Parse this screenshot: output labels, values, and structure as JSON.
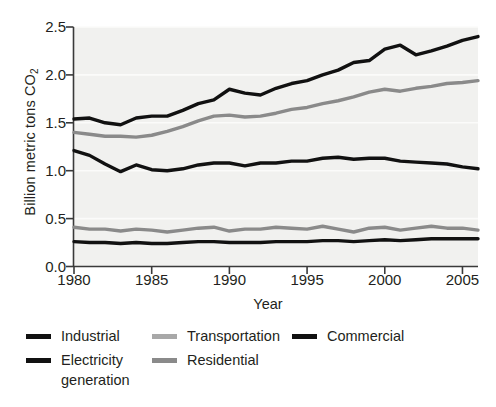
{
  "chart_data": {
    "type": "line",
    "title": "",
    "xlabel": "Year",
    "ylabel": "Billion metric tons CO2",
    "ylabel_plain": "Billion metric tons CO",
    "ylabel_sub": "2",
    "xlim": [
      1980,
      2006
    ],
    "ylim": [
      0.0,
      2.5
    ],
    "yticks": [
      "0.0",
      "0.5",
      "1.0",
      "1.5",
      "2.0",
      "2.5"
    ],
    "ytick_values": [
      0.0,
      0.5,
      1.0,
      1.5,
      2.0,
      2.5
    ],
    "xticks": [
      "1980",
      "1985",
      "1990",
      "1995",
      "2000",
      "2005"
    ],
    "xtick_values": [
      1980,
      1985,
      1990,
      1995,
      2000,
      2005
    ],
    "grid": "horizontal-faint",
    "legend_position": "below-plot",
    "plot_background": "#f1f1ef",
    "x": [
      1980,
      1981,
      1982,
      1983,
      1984,
      1985,
      1986,
      1987,
      1988,
      1989,
      1990,
      1991,
      1992,
      1993,
      1994,
      1995,
      1996,
      1997,
      1998,
      1999,
      2000,
      2001,
      2002,
      2003,
      2004,
      2005,
      2006
    ],
    "series": [
      {
        "name": "Electricity generation",
        "color": "#111111",
        "values": [
          1.54,
          1.55,
          1.5,
          1.48,
          1.55,
          1.57,
          1.57,
          1.63,
          1.7,
          1.74,
          1.85,
          1.81,
          1.79,
          1.86,
          1.91,
          1.94,
          2.0,
          2.05,
          2.13,
          2.15,
          2.27,
          2.31,
          2.21,
          2.25,
          2.3,
          2.36,
          2.4
        ]
      },
      {
        "name": "Transportation",
        "color": "#8a8a8a",
        "values": [
          1.4,
          1.38,
          1.36,
          1.36,
          1.35,
          1.37,
          1.41,
          1.46,
          1.52,
          1.57,
          1.58,
          1.56,
          1.57,
          1.6,
          1.64,
          1.66,
          1.7,
          1.73,
          1.77,
          1.82,
          1.85,
          1.83,
          1.86,
          1.88,
          1.91,
          1.92,
          1.94
        ]
      },
      {
        "name": "Industrial",
        "color": "#111111",
        "values": [
          1.21,
          1.16,
          1.07,
          0.99,
          1.06,
          1.01,
          1.0,
          1.02,
          1.06,
          1.08,
          1.08,
          1.05,
          1.08,
          1.08,
          1.1,
          1.1,
          1.13,
          1.14,
          1.12,
          1.13,
          1.13,
          1.1,
          1.09,
          1.08,
          1.07,
          1.04,
          1.02
        ]
      },
      {
        "name": "Residential",
        "color": "#8a8a8a",
        "values": [
          0.41,
          0.39,
          0.39,
          0.37,
          0.39,
          0.38,
          0.36,
          0.38,
          0.4,
          0.41,
          0.37,
          0.39,
          0.39,
          0.41,
          0.4,
          0.39,
          0.42,
          0.39,
          0.36,
          0.4,
          0.41,
          0.38,
          0.4,
          0.42,
          0.4,
          0.4,
          0.38
        ]
      },
      {
        "name": "Commercial",
        "color": "#111111",
        "values": [
          0.26,
          0.25,
          0.25,
          0.24,
          0.25,
          0.24,
          0.24,
          0.25,
          0.26,
          0.26,
          0.25,
          0.25,
          0.25,
          0.26,
          0.26,
          0.26,
          0.27,
          0.27,
          0.26,
          0.27,
          0.28,
          0.27,
          0.28,
          0.29,
          0.29,
          0.29,
          0.29
        ]
      }
    ]
  },
  "legend": {
    "columns": [
      {
        "items": [
          {
            "label": "Industrial",
            "color": "#111111"
          },
          {
            "label": "Electricity\ngeneration",
            "color": "#111111"
          }
        ]
      },
      {
        "items": [
          {
            "label": "Transportation",
            "color": "#a8a8a8"
          },
          {
            "label": "Residential",
            "color": "#8a8a8a"
          }
        ]
      },
      {
        "items": [
          {
            "label": "Commercial",
            "color": "#111111"
          }
        ]
      }
    ]
  }
}
